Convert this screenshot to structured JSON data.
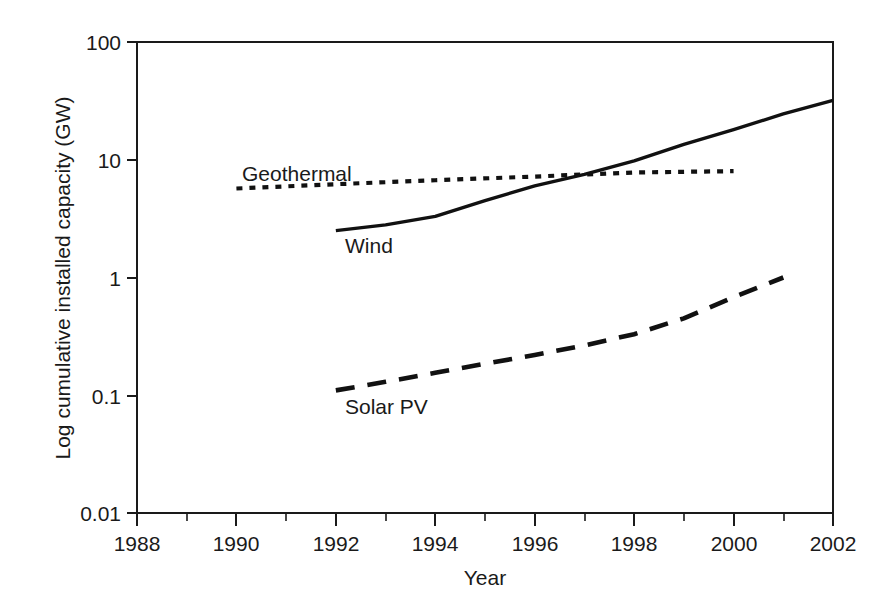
{
  "chart_data": {
    "type": "line",
    "title": "",
    "xlabel": "Year",
    "ylabel": "Log cumulative installed capacity (GW)",
    "xlim": [
      1988,
      2002
    ],
    "ylim": [
      0.01,
      100
    ],
    "yscale": "log",
    "grid": false,
    "legend_position": "inline-annotations",
    "x_ticks": [
      1988,
      1990,
      1992,
      1994,
      1996,
      1998,
      2000,
      2002
    ],
    "x_tick_labels": [
      "1988",
      "1990",
      "1992",
      "1994",
      "1996",
      "1998",
      "2000",
      "2002"
    ],
    "x_minor_ticks": [
      1989,
      1991,
      1993,
      1995,
      1997,
      1999,
      2001
    ],
    "y_ticks": [
      0.01,
      0.1,
      1,
      10,
      100
    ],
    "y_tick_labels": [
      "0.01",
      "0.1",
      "1",
      "10",
      "100"
    ],
    "series": [
      {
        "name": "Wind",
        "style": "solid",
        "label_text": "Wind",
        "x": [
          1992,
          1993,
          1994,
          1995,
          1996,
          1997,
          1998,
          1999,
          2000,
          2001,
          2002
        ],
        "values": [
          2.5,
          2.8,
          3.3,
          4.5,
          6.0,
          7.5,
          9.8,
          13.5,
          18.0,
          24.5,
          32.0
        ]
      },
      {
        "name": "Geothermal",
        "style": "dotted",
        "label_text": "Geothermal",
        "x": [
          1990,
          1992,
          1994,
          1996,
          1998,
          2000
        ],
        "values": [
          5.7,
          6.2,
          6.7,
          7.2,
          7.8,
          8.0
        ]
      },
      {
        "name": "Solar PV",
        "style": "dashed",
        "label_text": "Solar PV",
        "x": [
          1992,
          1993,
          1994,
          1995,
          1996,
          1997,
          1998,
          1999,
          2000,
          2001
        ],
        "values": [
          0.11,
          0.13,
          0.155,
          0.185,
          0.22,
          0.265,
          0.33,
          0.45,
          0.68,
          1.0
        ]
      }
    ],
    "annotations": [
      {
        "text": "Geothermal",
        "x": 1991.3,
        "y": 12.0
      },
      {
        "text": "Wind",
        "x": 1993.0,
        "y": 1.85
      },
      {
        "text": "Solar PV",
        "x": 1993.0,
        "y": 0.073
      }
    ]
  },
  "axis": {
    "y_title": "Log cumulative installed capacity (GW)",
    "x_title": "Year"
  },
  "labels": {
    "y0": "0.01",
    "y1": "0.1",
    "y2": "1",
    "y3": "10",
    "y4": "100",
    "x0": "1988",
    "x1": "1990",
    "x2": "1992",
    "x3": "1994",
    "x4": "1996",
    "x5": "1998",
    "x6": "2000",
    "x7": "2002",
    "geothermal": "Geothermal",
    "wind": "Wind",
    "solarpv": "Solar PV"
  },
  "colors": {
    "ink": "#1a1a1a",
    "background": "#ffffff"
  }
}
